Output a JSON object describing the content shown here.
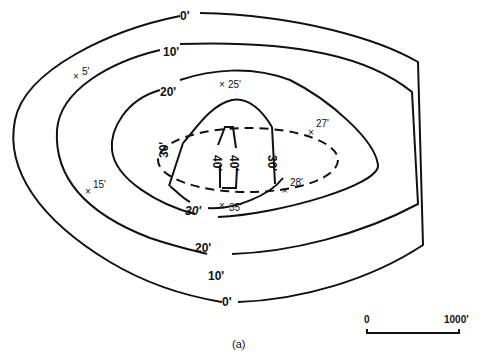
{
  "diagram": {
    "type": "isopach contour map",
    "panel_label": "(a)",
    "contours": [
      {
        "label": "0'",
        "value": 0
      },
      {
        "label": "10'",
        "value": 10
      },
      {
        "label": "20'",
        "value": 20
      },
      {
        "label": "30'",
        "value": 30
      },
      {
        "label": "40'",
        "value": 40
      }
    ],
    "labels": {
      "c0_top": "0'",
      "c0_bot": "0'",
      "c10_top": "10'",
      "c10_bot": "10'",
      "c20_top": "20'",
      "c20_bot": "20'",
      "c30_left": "30'",
      "c30_right": "30'",
      "c30_bot": "30'",
      "c40_a": "40'",
      "c40_b": "40'"
    },
    "points": [
      {
        "label": "5'",
        "value": 5
      },
      {
        "label": "25'",
        "value": 25
      },
      {
        "label": "27'",
        "value": 27
      },
      {
        "label": "15'",
        "value": 15
      },
      {
        "label": "28'",
        "value": 28
      },
      {
        "label": "35'",
        "value": 35
      }
    ],
    "scale_bar": {
      "start": "0",
      "end": "1000'"
    },
    "boundary": "dashed ellipse outline"
  }
}
